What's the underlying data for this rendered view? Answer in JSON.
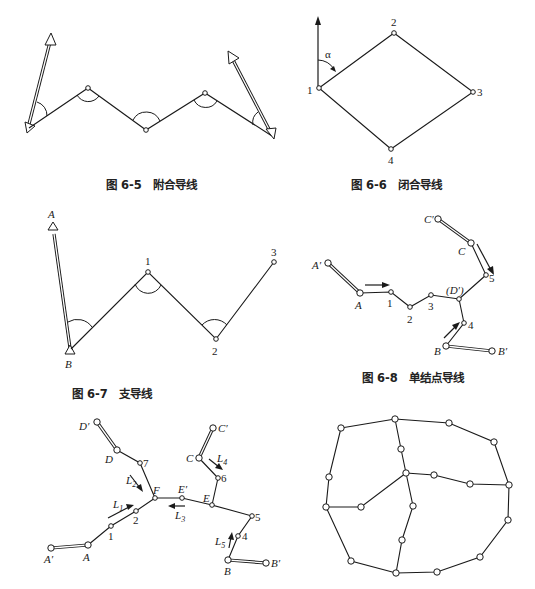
{
  "figures": [
    {
      "id": "6-5",
      "caption": "图 6-5　附合导线"
    },
    {
      "id": "6-6",
      "caption": "图 6-6　闭合导线",
      "labels": {
        "n1": "1",
        "n2": "2",
        "n3": "3",
        "n4": "4",
        "alpha": "α"
      }
    },
    {
      "id": "6-7",
      "caption": "图 6-7　支导线",
      "labels": {
        "A": "A",
        "B": "B",
        "n1": "1",
        "n2": "2",
        "n3": "3"
      }
    },
    {
      "id": "6-8",
      "caption": "图 6-8　单结点导线",
      "labels": {
        "Ap": "A′",
        "A": "A",
        "n1": "1",
        "n2": "2",
        "n3": "3",
        "Dp": "(D′)",
        "n4": "4",
        "B": "B",
        "Bp": "B′",
        "n5": "5",
        "C": "C",
        "Cp": "C′"
      }
    },
    {
      "id": "6-9",
      "labels": {
        "Dp": "D′",
        "D": "D",
        "n7": "7",
        "L2": "L",
        "L2sub": "2",
        "F": "F",
        "Ep": "E′",
        "E": "E",
        "L1": "L",
        "L1sub": "1",
        "L3": "L",
        "L3sub": "3",
        "n2": "2",
        "n1": "1",
        "A": "A",
        "Ap": "A′",
        "C": "C",
        "Cp": "C′",
        "L4": "L",
        "L4sub": "4",
        "n6": "6",
        "n5": "5",
        "n4": "4",
        "L5": "L",
        "L5sub": "5",
        "B": "B",
        "Bp": "B′"
      }
    },
    {
      "id": "6-10"
    }
  ]
}
